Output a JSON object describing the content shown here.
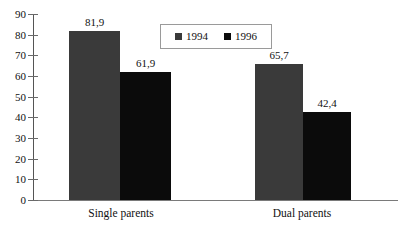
{
  "chart_data": {
    "type": "bar",
    "title": "",
    "subtitle": "",
    "xlabel": "",
    "ylabel": "",
    "categories": [
      "Single parents",
      "Dual parents"
    ],
    "series": [
      {
        "name": "1994",
        "values": [
          81.9,
          65.7
        ],
        "labels": [
          "81,9",
          "65,7"
        ],
        "color": "#3a3a3a"
      },
      {
        "name": "1996",
        "values": [
          61.9,
          42.4
        ],
        "labels": [
          "61,9",
          "42,4"
        ],
        "color": "#0b0b0b"
      }
    ],
    "ylim": [
      0,
      90
    ],
    "y_tick_step": 10,
    "y_ticks": [
      "90",
      "80",
      "70",
      "60",
      "50",
      "40",
      "30",
      "20",
      "10",
      "0"
    ],
    "grid": false,
    "legend_position": "top-center",
    "decimal_separator": ","
  },
  "legend": {
    "entries": [
      {
        "label": "1994",
        "swatch": "legend-swatch-1994"
      },
      {
        "label": "1996",
        "swatch": "legend-swatch-1996"
      }
    ]
  },
  "axis": {
    "y_labels": [
      "90",
      "80",
      "70",
      "60",
      "50",
      "40",
      "30",
      "20",
      "10",
      "0"
    ]
  },
  "groups": [
    {
      "category": "Single parents",
      "bars": [
        {
          "series": "1994",
          "label": "81,9",
          "value": 81.9
        },
        {
          "series": "1996",
          "label": "61,9",
          "value": 61.9
        }
      ]
    },
    {
      "category": "Dual parents",
      "bars": [
        {
          "series": "1994",
          "label": "65,7",
          "value": 65.7
        },
        {
          "series": "1996",
          "label": "42,4",
          "value": 42.4
        }
      ]
    }
  ]
}
